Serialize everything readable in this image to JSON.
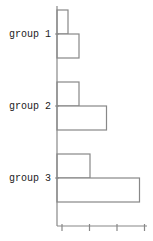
{
  "chart_data": {
    "type": "bar",
    "orientation": "horizontal",
    "title": "",
    "xlabel": "",
    "ylabel": "",
    "categories": [
      "group 1",
      "group 2",
      "group 3"
    ],
    "series": [
      {
        "name": "series 1",
        "values": [
          2,
          4,
          6
        ]
      },
      {
        "name": "series 2",
        "values": [
          4,
          9,
          15
        ]
      }
    ],
    "xlim": [
      0,
      17
    ],
    "x_ticks_count": 4,
    "tick_labels_visible": false,
    "grid": false,
    "legend": null,
    "colors": {
      "bar_fill": "#ffffff",
      "bar_stroke": "#888888",
      "axis": "#888888"
    }
  }
}
